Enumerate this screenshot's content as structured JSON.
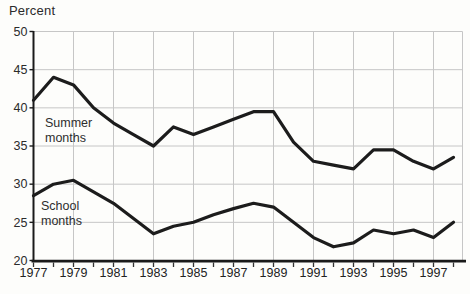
{
  "figure": {
    "y_axis_title": "Percent"
  },
  "chart_data": {
    "type": "line",
    "title": "",
    "ylabel": "Percent",
    "xlabel": "",
    "x": [
      1977,
      1978,
      1979,
      1980,
      1981,
      1982,
      1983,
      1984,
      1985,
      1986,
      1987,
      1988,
      1989,
      1990,
      1991,
      1992,
      1993,
      1994,
      1995,
      1996,
      1997,
      1998
    ],
    "x_tick_labels": [
      "1977",
      "1979",
      "1981",
      "1983",
      "1985",
      "1987",
      "1989",
      "1991",
      "1993",
      "1995",
      "1997"
    ],
    "x_ticks_every_year": true,
    "y_ticks": [
      20,
      25,
      30,
      35,
      40,
      45,
      50
    ],
    "y_tick_labels": [
      "20",
      "25",
      "30",
      "35",
      "40",
      "45",
      "50"
    ],
    "ylim": [
      20,
      50
    ],
    "xlim": [
      1977,
      1998.5
    ],
    "grid": true,
    "legend_position": "inline-labels-on-plot",
    "series": [
      {
        "name": "Summer months",
        "values": [
          41,
          44,
          43,
          40,
          38,
          36.5,
          35,
          37.5,
          36.5,
          37.5,
          38.5,
          39.5,
          39.5,
          35.5,
          33,
          32.5,
          32,
          34.5,
          34.5,
          33,
          32,
          33.5
        ]
      },
      {
        "name": "School months",
        "values": [
          28.5,
          30,
          30.5,
          29,
          27.5,
          25.5,
          23.5,
          24.5,
          25,
          26,
          26.8,
          27.5,
          27,
          25,
          23,
          21.8,
          22.3,
          24,
          23.5,
          24,
          23,
          25
        ]
      }
    ],
    "colors": {
      "line": "#1c1c1c",
      "grid": "#c6c6c6",
      "axis": "#1a1a1a",
      "tick": "#333333",
      "text": "#2b2b2b",
      "background": "#fdfdfb"
    }
  }
}
